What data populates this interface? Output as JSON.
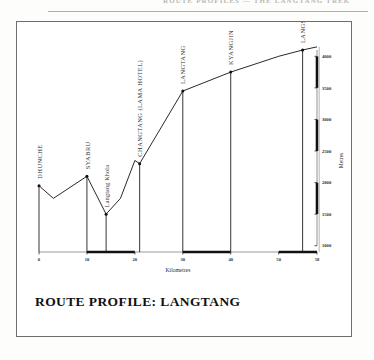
{
  "page": {
    "running_header": "ROUTE PROFILES — THE LANGTANG TREK",
    "caption": "ROUTE PROFILE:  LANGTANG"
  },
  "chart_data": {
    "type": "line",
    "title": "ROUTE PROFILE:  LANGTANG",
    "xlabel": "Kilometres",
    "ylabel": "Metres",
    "xlim": [
      0,
      58
    ],
    "ylim": [
      900,
      4100
    ],
    "grid": false,
    "legend": false,
    "xticks": [
      "0",
      "10",
      "20",
      "30",
      "40",
      "50",
      "58"
    ],
    "xtick_values": [
      0,
      10,
      20,
      30,
      40,
      50,
      58
    ],
    "yticks": [
      "1000",
      "1500",
      "2000",
      "2500",
      "3000",
      "3500",
      "4000"
    ],
    "ytick_values": [
      1000,
      1500,
      2000,
      2500,
      3000,
      3500,
      4000
    ],
    "x": [
      0,
      3,
      10,
      14,
      17,
      20,
      21,
      30,
      40,
      50,
      55,
      58
    ],
    "values": [
      1950,
      1750,
      2100,
      1500,
      1750,
      2350,
      2300,
      3450,
      3750,
      4000,
      4100,
      4150
    ],
    "waypoints": [
      {
        "label": "DHUNCHE",
        "km": 0,
        "metres": 1950,
        "style": "caps"
      },
      {
        "label": "SYABRU",
        "km": 10,
        "metres": 2100,
        "style": "caps"
      },
      {
        "label": "Langtang Khola",
        "km": 14,
        "metres": 1500,
        "style": "mixed"
      },
      {
        "label": "CHANGTANG (LAMA HOTEL)",
        "km": 21,
        "metres": 2300,
        "style": "caps"
      },
      {
        "label": "LANGTANG",
        "km": 30,
        "metres": 3450,
        "style": "caps"
      },
      {
        "label": "KYANGJIN",
        "km": 40,
        "metres": 3750,
        "style": "caps"
      },
      {
        "label": "LANGSHISA",
        "km": 55,
        "metres": 4100,
        "style": "caps"
      }
    ]
  },
  "colors": {
    "ink": "#111111",
    "frame": "#6e6e6e",
    "axis_dark": "#111111",
    "axis_light": "#9a9a9a",
    "paper": "#fdfdfb"
  }
}
